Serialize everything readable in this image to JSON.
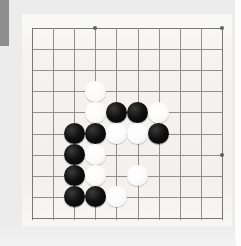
{
  "image": {
    "title": "Go board position diagram",
    "width": 241,
    "height": 246,
    "background_color": "#ececec",
    "board_color": "#f4f3f1",
    "grid_color": "#8f9094",
    "black_stone_color": "#111111",
    "white_stone_color": "#fbfbfb"
  },
  "gutter_bar": {
    "name": "page-gutter-marker",
    "color": "#8d8d8d"
  },
  "board": {
    "label": "Go board",
    "origin_x": 32,
    "origin_y": 28,
    "cell_size": 21.1,
    "columns": 10,
    "rows": 10,
    "grid_lines_vertical": [
      0,
      1,
      2,
      3,
      4,
      5,
      6,
      7,
      8,
      9
    ],
    "grid_lines_horizontal": [
      0,
      1,
      2,
      3,
      4,
      5,
      6,
      7,
      8,
      9
    ],
    "star_points": [
      {
        "col": 3,
        "row": 0
      },
      {
        "col": 9,
        "row": 0
      },
      {
        "col": 9,
        "row": 6
      }
    ],
    "stone_diameter": 21
  },
  "stones": [
    {
      "color": "white",
      "col": 3,
      "row": 3
    },
    {
      "color": "white",
      "col": 3,
      "row": 4
    },
    {
      "color": "black",
      "col": 4,
      "row": 4
    },
    {
      "color": "black",
      "col": 5,
      "row": 4
    },
    {
      "color": "white",
      "col": 6,
      "row": 4
    },
    {
      "color": "black",
      "col": 2,
      "row": 5
    },
    {
      "color": "black",
      "col": 3,
      "row": 5
    },
    {
      "color": "white",
      "col": 4,
      "row": 5
    },
    {
      "color": "white",
      "col": 5,
      "row": 5
    },
    {
      "color": "black",
      "col": 6,
      "row": 5
    },
    {
      "color": "black",
      "col": 2,
      "row": 6
    },
    {
      "color": "white",
      "col": 3,
      "row": 6
    },
    {
      "color": "black",
      "col": 2,
      "row": 7
    },
    {
      "color": "white",
      "col": 3,
      "row": 7
    },
    {
      "color": "white",
      "col": 5,
      "row": 7
    },
    {
      "color": "black",
      "col": 2,
      "row": 8
    },
    {
      "color": "black",
      "col": 3,
      "row": 8
    },
    {
      "color": "white",
      "col": 4,
      "row": 8
    }
  ],
  "counts": {
    "black_stones": 9,
    "white_stones": 9,
    "total_stones": 18
  }
}
